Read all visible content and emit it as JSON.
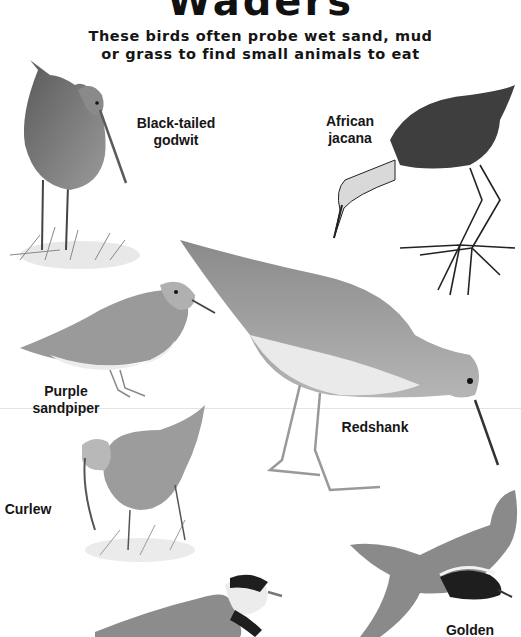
{
  "page": {
    "title": "Waders",
    "subtitle_line1": "These birds often probe wet sand, mud",
    "subtitle_line2": "or grass to find small animals to eat"
  },
  "birds": [
    {
      "id": "black-tailed-godwit",
      "label_line1": "Black-tailed",
      "label_line2": "godwit",
      "icon": "godwit-illustration"
    },
    {
      "id": "african-jacana",
      "label_line1": "African",
      "label_line2": "jacana",
      "icon": "jacana-illustration"
    },
    {
      "id": "purple-sandpiper",
      "label_line1": "Purple",
      "label_line2": "sandpiper",
      "icon": "sandpiper-illustration"
    },
    {
      "id": "redshank",
      "label_line1": "Redshank",
      "icon": "redshank-illustration"
    },
    {
      "id": "curlew",
      "label_line1": "Curlew",
      "icon": "curlew-illustration"
    },
    {
      "id": "ringed-plover",
      "icon": "plover-illustration"
    },
    {
      "id": "golden-plover",
      "label_line1": "Golden",
      "icon": "golden-plover-illustration"
    }
  ],
  "colors": {
    "background": "#ffffff",
    "text": "#111111",
    "divider": "#e4e4e4"
  }
}
